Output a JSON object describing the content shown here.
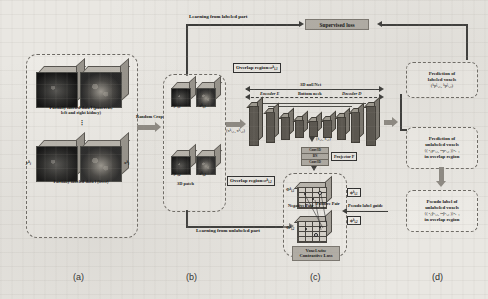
{
  "figure": {
    "panels": [
      {
        "id": "a",
        "label": "(a)"
      },
      {
        "id": "b",
        "label": "(b)"
      },
      {
        "id": "c",
        "label": "(c)"
      },
      {
        "id": "d",
        "label": "(d)"
      }
    ]
  },
  "panel_a": {
    "dataset_top_caption_line1": "Partially labeled data l (pancreas,",
    "dataset_top_caption_line2": "left and right kidney)",
    "dataset_bottom_caption": "Partially labeled data l (liver)",
    "vertical_dots": "⋮",
    "label_volume_tag": "y",
    "image_volume_tag": "x",
    "superscript": "k",
    "subscript_label": "i"
  },
  "panel_b": {
    "random_crop_label": "Random Crop",
    "patch_caption": "3D patch",
    "patch_top_left_label": "y",
    "patch_top_left_sub": "i,1",
    "patch_top_right_label": "x",
    "patch_top_right_sub": "i,1",
    "patch_bottom_left_label": "y",
    "patch_bottom_left_sub": "i,2",
    "patch_bottom_right_label": "x",
    "patch_bottom_right_sub": "i,2",
    "superscript": "k",
    "overlap_pair_note": "(xᵏᵢ,₁, xᵏᵢ,₂)"
  },
  "panel_c": {
    "overlap_region_top": "Overlap region:",
    "overlap_region_top_sym": "o",
    "overlap_region_top_sub": "i,1",
    "overlap_region_bottom": "Overlap region:",
    "overlap_region_bottom_sym": "o",
    "overlap_region_bottom_sub": "i,2",
    "network_name": "3D nnUNet",
    "encoder_label": "Encoder E",
    "bottleneck_label": "Bottom neck",
    "decoder_label": "Decoder D",
    "feature_pair_label": "(fᵢ,₁, fᵢ,₂)",
    "module_rows": [
      "Conv3D",
      "BN",
      "Conv3D"
    ],
    "projector_label": "Projector P",
    "negative_pair_label": "Negative Pair",
    "positive_pair_label": "Positive Pair",
    "contrastive_loss_line1": "Voxel-wise",
    "contrastive_loss_line2": "Contrastive Loss",
    "embedding_top_label": "Φ",
    "embedding_top_sub": "i,1",
    "embedding_bottom_label": "Φ",
    "embedding_bottom_sub": "i,2",
    "phi_out_top": "ϕ",
    "phi_out_top_sub": "i,1",
    "phi_out_bottom": "ϕ",
    "phi_out_bottom_sub": "i,2",
    "pseudo_label_guide": "Pseudo label guide"
  },
  "panel_d": {
    "prediction_labeled_line1": "Prediction of",
    "prediction_labeled_line2": "labeled voxels",
    "prediction_labeled_math": "(ᵏpˡᵢ,₁, ᵏpˡᵢ,₂)",
    "prediction_unlabeled_line1": "Prediction of",
    "prediction_unlabeled_line2": "unlabeled voxels",
    "prediction_unlabeled_math": "{( ⁿ₁pᵏᵢ,₁, ⁿ²pᵏᵢ,₂ )}ⁿₒ₌₁",
    "prediction_unlabeled_line4": "in overlap region",
    "pseudo_label_line1": "Pseudo label of",
    "pseudo_label_line2": "unlabeled voxels",
    "pseudo_label_math": "{( ⁿ₁ŷᵏᵢ,₁, ⁿ²ŷᵏᵢ,₂ )}ⁿₒ₌₁",
    "pseudo_label_line4": "in overlap region"
  },
  "flows": {
    "learning_labeled": "Learning from labeled part",
    "learning_unlabeled": "Learning from unlabeled part",
    "supervised_loss": "Supervised loss"
  },
  "colors": {
    "paper": "#e9e7e2",
    "ink": "#1a1a1a",
    "arrow": "#3a3a38",
    "fat_arrow": "#8d8982",
    "grey_box": "#b2aea6",
    "cube_dark": "#2a2a2a",
    "cube_top": "#b9b5ad",
    "cube_side": "#97938b",
    "slab_front": "#58544d"
  }
}
